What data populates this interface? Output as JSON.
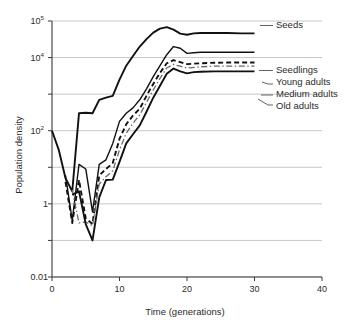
{
  "chart_data": {
    "type": "line",
    "title": "",
    "xlabel": "Time (generations)",
    "ylabel": "Population density",
    "xlim": [
      0,
      40
    ],
    "ylim": [
      0.01,
      100000
    ],
    "yscale": "log",
    "grid": true,
    "legend_position": "right-inline-labels",
    "xticks": [
      0,
      10,
      20,
      30,
      40
    ],
    "xtick_labels": [
      "0",
      "10",
      "20",
      "30",
      "40"
    ],
    "yticks": [
      0.01,
      0.1,
      1,
      10,
      100,
      1000,
      10000,
      100000
    ],
    "ytick_labels": [
      "0.01",
      "",
      "1",
      "",
      "10²",
      "",
      "10⁴",
      "10⁵"
    ],
    "ytick_labels_visible": [
      "0.01",
      "1",
      "10²",
      "10⁴",
      "10⁵"
    ],
    "series": [
      {
        "name": "Seeds",
        "label": "Seeds",
        "style": "solid",
        "color": "#111111",
        "width": 1.9,
        "x": [
          0,
          1,
          2,
          3,
          4,
          5,
          6,
          7,
          8,
          9,
          10,
          11,
          12,
          13,
          14,
          15,
          16,
          17,
          18,
          19,
          20,
          21,
          22,
          23,
          24,
          26,
          28,
          30
        ],
        "y": [
          100,
          30,
          5,
          2.2,
          300,
          310,
          300,
          700,
          800,
          900,
          2500,
          6000,
          11000,
          20000,
          32000,
          48000,
          62000,
          68000,
          58000,
          45000,
          42000,
          46000,
          47000,
          47000,
          47000,
          47000,
          46000,
          46000
        ]
      },
      {
        "name": "Seedlings",
        "label": "Seedlings",
        "style": "solid",
        "color": "#111111",
        "width": 1.4,
        "x": [
          2,
          3,
          4,
          5,
          6,
          7,
          8,
          9,
          10,
          11,
          12,
          13,
          14,
          15,
          16,
          17,
          18,
          19,
          20,
          21,
          22,
          24,
          26,
          28,
          30
        ],
        "y": [
          6,
          0.35,
          12,
          9,
          0.6,
          12,
          16,
          45,
          180,
          300,
          420,
          700,
          1400,
          3000,
          6000,
          12000,
          20000,
          18000,
          13000,
          13500,
          14000,
          14000,
          14000,
          14000,
          14000
        ]
      },
      {
        "name": "Young adults",
        "label": "Young adults",
        "style": "dashed",
        "color": "#111111",
        "width": 1.9,
        "x": [
          2,
          3,
          4,
          5,
          6,
          7,
          8,
          9,
          10,
          11,
          12,
          13,
          14,
          15,
          16,
          17,
          18,
          19,
          20,
          22,
          24,
          26,
          28,
          30
        ],
        "y": [
          4,
          0.3,
          4.5,
          0.4,
          0.28,
          6,
          9,
          13,
          60,
          150,
          260,
          400,
          900,
          1900,
          3800,
          7000,
          8500,
          7500,
          6600,
          7000,
          7200,
          7300,
          7300,
          7300
        ]
      },
      {
        "name": "Medium adults",
        "label": "Medium adults",
        "style": "dashdot",
        "color": "#6a6a6a",
        "width": 1.3,
        "x": [
          3,
          4,
          5,
          6,
          7,
          8,
          9,
          10,
          11,
          12,
          13,
          14,
          15,
          16,
          17,
          18,
          19,
          20,
          22,
          24,
          26,
          28,
          30
        ],
        "y": [
          2.4,
          0.3,
          0.32,
          0.25,
          3.5,
          5.5,
          8,
          30,
          85,
          160,
          270,
          600,
          1300,
          2700,
          5200,
          6500,
          5800,
          5200,
          5600,
          5800,
          5800,
          5800,
          5800
        ]
      },
      {
        "name": "Old adults",
        "label": "Old adults",
        "style": "solid",
        "color": "#111111",
        "width": 1.9,
        "x": [
          3,
          4,
          5,
          6,
          7,
          8,
          9,
          10,
          11,
          12,
          13,
          14,
          15,
          16,
          17,
          18,
          19,
          20,
          21,
          22,
          24,
          26,
          28,
          30
        ],
        "y": [
          1.8,
          2.2,
          0.28,
          0.1,
          1.5,
          4.5,
          4.6,
          14,
          45,
          80,
          140,
          330,
          800,
          1700,
          3600,
          5000,
          4200,
          3700,
          4000,
          4100,
          4200,
          4200,
          4200,
          4200
        ]
      }
    ]
  },
  "axes": {
    "ylabel": "Population density",
    "xlabel": "Time (generations)"
  }
}
